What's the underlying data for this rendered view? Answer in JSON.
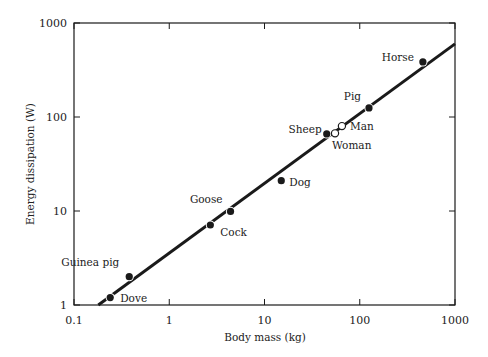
{
  "chart_data": {
    "type": "scatter",
    "title": "",
    "xlabel": "Body mass   (kg)",
    "ylabel": "Energy dissipation   (W)",
    "xscale": "log",
    "yscale": "log",
    "xlim": [
      0.1,
      1000
    ],
    "ylim": [
      1,
      1000
    ],
    "xticks": [
      "0.1",
      "1",
      "10",
      "100",
      "1000"
    ],
    "yticks": [
      "1",
      "10",
      "100",
      "1000"
    ],
    "grid": false,
    "legend": null,
    "points": [
      {
        "label": "Dove",
        "x": 0.24,
        "y": 1.2,
        "marker": "filled"
      },
      {
        "label": "Guinea pig",
        "x": 0.38,
        "y": 2.0,
        "marker": "filled"
      },
      {
        "label": "Cock",
        "x": 2.7,
        "y": 7.1,
        "marker": "filled"
      },
      {
        "label": "Goose",
        "x": 4.4,
        "y": 9.9,
        "marker": "filled"
      },
      {
        "label": "Dog",
        "x": 15,
        "y": 21,
        "marker": "filled"
      },
      {
        "label": "Sheep",
        "x": 45,
        "y": 66,
        "marker": "filled"
      },
      {
        "label": "Woman",
        "x": 55,
        "y": 67,
        "marker": "open"
      },
      {
        "label": "Man",
        "x": 65,
        "y": 80,
        "marker": "open"
      },
      {
        "label": "Pig",
        "x": 125,
        "y": 125,
        "marker": "filled"
      },
      {
        "label": "Horse",
        "x": 460,
        "y": 385,
        "marker": "filled"
      }
    ],
    "fit_line": {
      "x": [
        0.18,
        1000
      ],
      "y": [
        1,
        600
      ],
      "style": "solid thick black"
    }
  },
  "plot": {
    "left": 74,
    "right": 455,
    "top": 23,
    "bottom": 305,
    "x_decade_px": 95.25,
    "y_decade_px": 94
  },
  "label_offsets": {
    "Dove": [
      10,
      4,
      "start"
    ],
    "Guinea pig": [
      -10,
      -11,
      "end"
    ],
    "Cock": [
      10,
      11,
      "start"
    ],
    "Goose": [
      -8,
      -8,
      "end"
    ],
    "Dog": [
      8,
      5,
      "start"
    ],
    "Sheep": [
      -5,
      -1,
      "end"
    ],
    "Woman": [
      -3,
      16,
      "start"
    ],
    "Man": [
      8,
      4,
      "start"
    ],
    "Pig": [
      -8,
      -8,
      "end"
    ],
    "Horse": [
      -9,
      -1,
      "end"
    ]
  },
  "colors": {
    "ink": "#1a1a1a",
    "background": "#ffffff"
  }
}
